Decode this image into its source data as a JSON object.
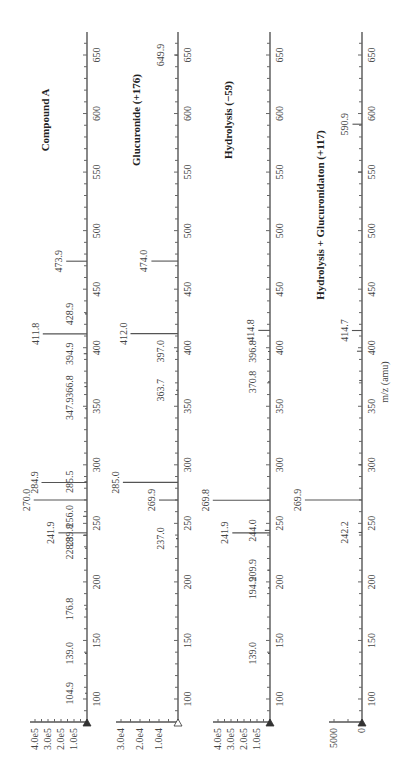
{
  "figure": {
    "orientation": "rotated-90-clockwise",
    "xlabel": "m/z (amu)",
    "x_ticks": [
      100,
      150,
      200,
      250,
      300,
      350,
      400,
      450,
      500,
      550,
      600,
      650
    ]
  },
  "panels": [
    {
      "title": "Compound A",
      "baseline_x": 87,
      "px_per_unit": 0.00013,
      "y_tick_labels": [
        "1.0e5",
        "2.0e5",
        "3.0e5",
        "4.0e5"
      ],
      "y_tick_values": [
        100000,
        200000,
        300000,
        400000
      ],
      "marker": "filled",
      "peaks": [
        {
          "mz": 104.9,
          "label": "104.9",
          "intensity": 5000
        },
        {
          "mz": 139.0,
          "label": "139.0",
          "intensity": 8000
        },
        {
          "mz": 176.8,
          "label": "176.8",
          "intensity": 8000
        },
        {
          "mz": 228.8,
          "label": "228.8",
          "intensity": 10000
        },
        {
          "mz": 239.8,
          "label": "239.8",
          "intensity": 30000
        },
        {
          "mz": 241.9,
          "label": "241.9",
          "intensity": 220000
        },
        {
          "mz": 256.0,
          "label": "256.0",
          "intensity": 30000
        },
        {
          "mz": 270.0,
          "label": "270.0",
          "intensity": 410000
        },
        {
          "mz": 284.9,
          "label": "284.9",
          "intensity": 350000
        },
        {
          "mz": 285.5,
          "label": "285.5",
          "intensity": 20000
        },
        {
          "mz": 347.9,
          "label": "347.9",
          "intensity": 5000
        },
        {
          "mz": 366.8,
          "label": "366.8",
          "intensity": 20000
        },
        {
          "mz": 394.9,
          "label": "394.9",
          "intensity": 25000
        },
        {
          "mz": 411.8,
          "label": "411.8",
          "intensity": 340000
        },
        {
          "mz": 428.9,
          "label": "428.9",
          "intensity": 10000
        },
        {
          "mz": 473.9,
          "label": "473.9",
          "intensity": 160000
        }
      ]
    },
    {
      "title": "Glucuronide (+176)",
      "baseline_x": 178,
      "px_per_unit": 0.0019,
      "y_tick_labels": [
        "1.0e4",
        "2.0e4",
        "3.0e4"
      ],
      "y_tick_values": [
        10000,
        20000,
        30000
      ],
      "marker": "open",
      "peaks": [
        {
          "mz": 237.0,
          "label": "237.0",
          "intensity": 800
        },
        {
          "mz": 269.9,
          "label": "269.9",
          "intensity": 10000
        },
        {
          "mz": 285.0,
          "label": "285.0",
          "intensity": 29000
        },
        {
          "mz": 363.7,
          "label": "363.7",
          "intensity": 800
        },
        {
          "mz": 397.0,
          "label": "397.0",
          "intensity": 600
        },
        {
          "mz": 412.0,
          "label": "412.0",
          "intensity": 25000
        },
        {
          "mz": 474.0,
          "label": "474.0",
          "intensity": 14000
        },
        {
          "mz": 649.9,
          "label": "649.9",
          "intensity": 1500
        }
      ]
    },
    {
      "title": "Hydrolysis (−59)",
      "baseline_x": 270,
      "px_per_unit": 0.00013,
      "y_tick_labels": [
        "1.0e5",
        "2.0e5",
        "3.0e5",
        "4.0e5"
      ],
      "y_tick_values": [
        100000,
        200000,
        300000,
        400000
      ],
      "marker": "filled",
      "peaks": [
        {
          "mz": 139.0,
          "label": "139.0",
          "intensity": 8000
        },
        {
          "mz": 194.9,
          "label": "194.9",
          "intensity": 5000
        },
        {
          "mz": 209.9,
          "label": "209.9",
          "intensity": 8000
        },
        {
          "mz": 241.9,
          "label": "241.9",
          "intensity": 290000
        },
        {
          "mz": 244.0,
          "label": "244.0",
          "intensity": 40000
        },
        {
          "mz": 269.8,
          "label": "269.8",
          "intensity": 440000
        },
        {
          "mz": 370.8,
          "label": "370.8",
          "intensity": 10000
        },
        {
          "mz": 396.8,
          "label": "396.8",
          "intensity": 15000
        },
        {
          "mz": 414.8,
          "label": "414.8",
          "intensity": 90000
        }
      ]
    },
    {
      "title": "Hydrolysis + Glucuronidaton (+117)",
      "baseline_x": 362,
      "px_per_unit": 0.0056,
      "y_tick_labels": [
        "0",
        "5000"
      ],
      "y_tick_values": [
        0,
        5000
      ],
      "marker": "filled",
      "peaks": [
        {
          "mz": 242.2,
          "label": "242.2",
          "intensity": 600
        },
        {
          "mz": 269.9,
          "label": "269.9",
          "intensity": 10200
        },
        {
          "mz": 300.0,
          "label": "",
          "intensity": 500
        },
        {
          "mz": 372.0,
          "label": "",
          "intensity": 500
        },
        {
          "mz": 397.0,
          "label": "",
          "intensity": 900
        },
        {
          "mz": 414.7,
          "label": "414.7",
          "intensity": 1800
        },
        {
          "mz": 550.0,
          "label": "",
          "intensity": 700
        },
        {
          "mz": 590.9,
          "label": "590.9",
          "intensity": 1700
        }
      ]
    }
  ],
  "chart_data": [
    {
      "type": "bar",
      "title": "Compound A",
      "xlabel": "m/z (amu)",
      "ylabel": "Intensity",
      "xlim": [
        80,
        665
      ],
      "ylim": [
        0,
        420000
      ],
      "y_ticks": [
        "1.0e5",
        "2.0e5",
        "3.0e5",
        "4.0e5"
      ],
      "x": [
        104.9,
        139.0,
        176.8,
        228.8,
        239.8,
        241.9,
        256.0,
        270.0,
        284.9,
        285.5,
        347.9,
        366.8,
        394.9,
        411.8,
        428.9,
        473.9
      ],
      "values": [
        5000,
        8000,
        8000,
        10000,
        30000,
        220000,
        30000,
        410000,
        350000,
        20000,
        5000,
        20000,
        25000,
        340000,
        10000,
        160000
      ]
    },
    {
      "type": "bar",
      "title": "Glucuronide (+176)",
      "xlabel": "m/z (amu)",
      "ylabel": "Intensity",
      "xlim": [
        80,
        665
      ],
      "ylim": [
        0,
        31000
      ],
      "y_ticks": [
        "1.0e4",
        "2.0e4",
        "3.0e4"
      ],
      "x": [
        237.0,
        269.9,
        285.0,
        363.7,
        397.0,
        412.0,
        474.0,
        649.9
      ],
      "values": [
        800,
        10000,
        29000,
        800,
        600,
        25000,
        14000,
        1500
      ]
    },
    {
      "type": "bar",
      "title": "Hydrolysis (−59)",
      "xlabel": "m/z (amu)",
      "ylabel": "Intensity",
      "xlim": [
        80,
        665
      ],
      "ylim": [
        0,
        450000
      ],
      "y_ticks": [
        "1.0e5",
        "2.0e5",
        "3.0e5",
        "4.0e5"
      ],
      "x": [
        139.0,
        194.9,
        209.9,
        241.9,
        244.0,
        269.8,
        370.8,
        396.8,
        414.8
      ],
      "values": [
        8000,
        5000,
        8000,
        290000,
        40000,
        440000,
        10000,
        15000,
        90000
      ]
    },
    {
      "type": "bar",
      "title": "Hydrolysis + Glucuronidaton (+117)",
      "xlabel": "m/z (amu)",
      "ylabel": "Intensity",
      "xlim": [
        80,
        665
      ],
      "ylim": [
        0,
        10500
      ],
      "y_ticks": [
        "0",
        "5000"
      ],
      "x": [
        242.2,
        269.9,
        414.7,
        590.9
      ],
      "values": [
        600,
        10200,
        1800,
        1700
      ]
    }
  ]
}
